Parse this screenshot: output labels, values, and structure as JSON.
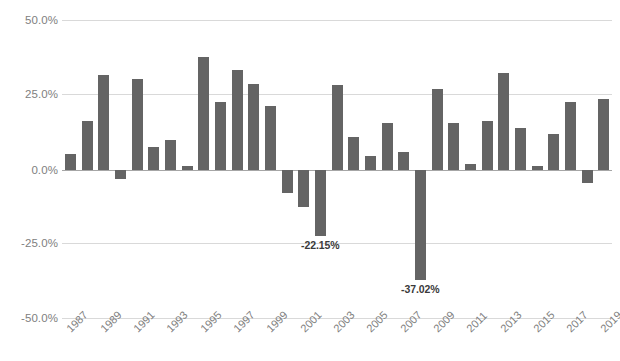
{
  "chart_data": {
    "type": "bar",
    "title": "",
    "subtitle": "",
    "xlabel": "",
    "ylabel": "",
    "ylim": [
      -50.0,
      50.0
    ],
    "grid": true,
    "legend": null,
    "legend_position": "none",
    "y_tick_labels": [
      "50.0%",
      "25.0%",
      "0.0%",
      "-25.0%",
      "-50.0%"
    ],
    "y_ticks": [
      50.0,
      25.0,
      0.0,
      -25.0,
      -50.0
    ],
    "x_tick_labels": [
      "1987",
      "1989",
      "1991",
      "1993",
      "1995",
      "1997",
      "1999",
      "2001",
      "2003",
      "2005",
      "2007",
      "2009",
      "2011",
      "2013",
      "2015",
      "2017",
      "2019"
    ],
    "bar_color": "#646464",
    "categories": [
      "1987",
      "1988",
      "1989",
      "1990",
      "1991",
      "1992",
      "1993",
      "1994",
      "1995",
      "1996",
      "1997",
      "1998",
      "1999",
      "2000",
      "2001",
      "2002",
      "2003",
      "2004",
      "2005",
      "2006",
      "2007",
      "2008",
      "2009",
      "2010",
      "2011",
      "2012",
      "2013",
      "2014",
      "2015",
      "2016",
      "2017",
      "2018",
      "2019"
    ],
    "values": [
      5.4,
      16.4,
      31.8,
      -3.1,
      30.6,
      7.8,
      10.2,
      1.3,
      37.8,
      22.8,
      33.6,
      29.0,
      21.5,
      -7.8,
      -12.4,
      -22.15,
      28.5,
      11.1,
      4.8,
      15.9,
      6.0,
      -37.02,
      27.2,
      15.8,
      2.1,
      16.4,
      32.5,
      14.0,
      1.4,
      12.1,
      22.8,
      -4.5,
      23.8
    ],
    "annotations": [
      {
        "category": "2002",
        "text": "-22.15%",
        "value": -22.15
      },
      {
        "category": "2008",
        "text": "-37.02%",
        "value": -37.02
      }
    ]
  }
}
